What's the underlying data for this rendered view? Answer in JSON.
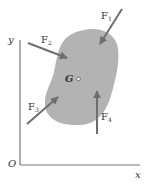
{
  "diagram": {
    "axes": {
      "origin_label": "O",
      "x_label": "x",
      "y_label": "y"
    },
    "body": {
      "centroid_label": "G",
      "fill_color": "#b3b3b3"
    },
    "forces": [
      {
        "name": "F",
        "sub": "1",
        "direction": "down-left"
      },
      {
        "name": "F",
        "sub": "2",
        "direction": "right-down"
      },
      {
        "name": "F",
        "sub": "3",
        "direction": "up-right"
      },
      {
        "name": "F",
        "sub": "4",
        "direction": "up"
      }
    ],
    "arrow_color": "#6e6e6e",
    "axis_color": "#777777"
  }
}
